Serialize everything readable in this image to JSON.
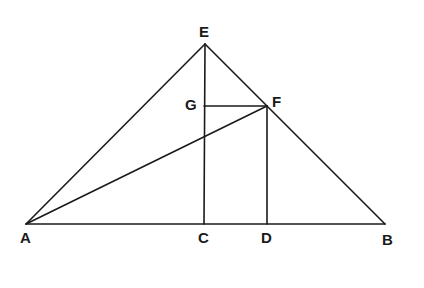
{
  "diagram": {
    "type": "geometric-figure",
    "points": {
      "A": {
        "label": "A",
        "x": 26,
        "y": 224
      },
      "B": {
        "label": "B",
        "x": 385,
        "y": 224
      },
      "C": {
        "label": "C",
        "x": 204,
        "y": 224
      },
      "D": {
        "label": "D",
        "x": 267,
        "y": 224
      },
      "E": {
        "label": "E",
        "x": 205,
        "y": 44
      },
      "F": {
        "label": "F",
        "x": 267,
        "y": 106
      },
      "G": {
        "label": "G",
        "x": 204,
        "y": 106
      }
    },
    "segments": [
      [
        "A",
        "B"
      ],
      [
        "A",
        "E"
      ],
      [
        "E",
        "B"
      ],
      [
        "E",
        "C"
      ],
      [
        "G",
        "F"
      ],
      [
        "F",
        "D"
      ],
      [
        "A",
        "F"
      ]
    ],
    "labels": {
      "A": "A",
      "B": "B",
      "C": "C",
      "D": "D",
      "E": "E",
      "F": "F",
      "G": "G"
    }
  }
}
